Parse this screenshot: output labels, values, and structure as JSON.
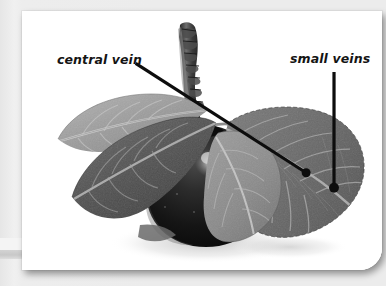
{
  "slide": {
    "background_color": "#ececec",
    "card_background": "#ffffff"
  },
  "photo": {
    "subject": "apple on a branch with leaves",
    "alt": "Black and white photograph of a dark apple hanging from a woody stem, flanked by four leaves",
    "palette": {
      "apple_dark": "#1c1c1c",
      "apple_highlight": "#cfcfcf",
      "leaf_light": "#9a9a9a",
      "leaf_mid": "#6f6f6f",
      "leaf_dark": "#4a4a4a",
      "stem": "#3a3a3a",
      "shadow": "#d8d8d8",
      "background": "#ffffff"
    }
  },
  "annotations": {
    "line_color": "#0d0d0d",
    "dot_color": "#0d0d0d",
    "items": [
      {
        "id": "central-vein",
        "label": "central vein",
        "leader": {
          "type": "diagonal",
          "x1": 128,
          "y1": 56,
          "x2": 287,
          "y2": 158
        },
        "dot": {
          "x": 287,
          "y": 158,
          "r": 4.2
        }
      },
      {
        "id": "small-veins",
        "label": "small veins",
        "leader": {
          "type": "vertical",
          "x1": 313,
          "y1": 64,
          "x2": 313,
          "y2": 172
        },
        "dot": {
          "x": 313,
          "y": 172,
          "r": 4.6
        }
      }
    ]
  }
}
